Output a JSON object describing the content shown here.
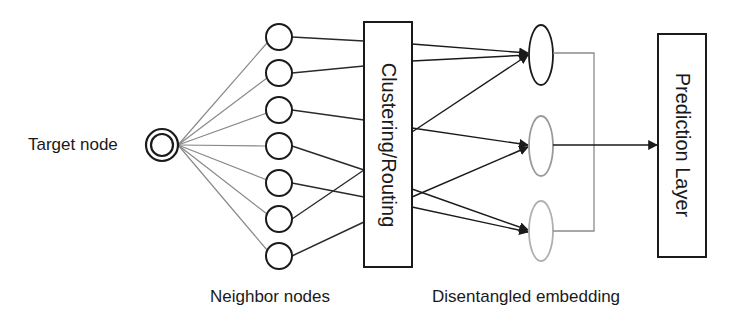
{
  "diagram": {
    "target_node": {
      "label": "Target node",
      "cx": 162,
      "cy": 145
    },
    "neighbor_nodes": {
      "label": "Neighbor nodes",
      "x": 279,
      "r": 13,
      "y": [
        37,
        73,
        110,
        146,
        183,
        219,
        256
      ]
    },
    "routing_box": {
      "label": "Clustering/Routing",
      "x": 364,
      "y": 22,
      "w": 48,
      "h": 245
    },
    "embeddings": {
      "label": "Disentangled embedding",
      "cx": 541,
      "rx": 12,
      "ry": 30,
      "items": [
        {
          "cy": 55,
          "stroke": "#1a1a1a"
        },
        {
          "cy": 146,
          "stroke": "#9a9a9a"
        },
        {
          "cy": 231,
          "stroke": "#b0b0b0"
        }
      ]
    },
    "prediction_box": {
      "label": "Prediction Layer",
      "x": 658,
      "y": 34,
      "w": 48,
      "h": 223
    },
    "colors": {
      "stroke_dark": "#1a1a1a",
      "stroke_light": "#888888",
      "bracket": "#8c8c8c",
      "background": "#ffffff"
    }
  }
}
